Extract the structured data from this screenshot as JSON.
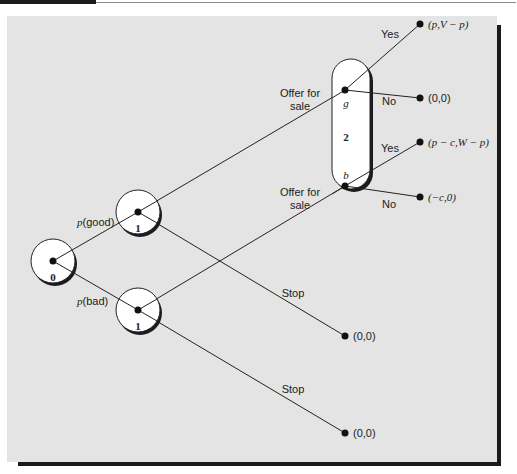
{
  "diagram": {
    "type": "extensive-form game tree",
    "nodes": {
      "root": {
        "player_label": "0"
      },
      "good_node": {
        "player_label": "1"
      },
      "bad_node": {
        "player_label": "1"
      },
      "info_set": {
        "player_label": "2",
        "good_label": "g",
        "bad_label": "b"
      }
    },
    "branches": {
      "p_good": {
        "prefix": "p",
        "suffix": "(good)"
      },
      "p_bad": {
        "prefix": "p",
        "suffix": "(bad)"
      },
      "offer_good": {
        "line1": "Offer for",
        "line2": "sale"
      },
      "offer_bad": {
        "line1": "Offer for",
        "line2": "sale"
      },
      "stop_good": "Stop",
      "stop_bad": "Stop",
      "yes_good": "Yes",
      "no_good": "No",
      "yes_bad": "Yes",
      "no_bad": "No"
    },
    "payoffs": {
      "good_yes": "(p,V − p)",
      "good_no": "(0,0)",
      "bad_yes": "(p − c,W − p)",
      "bad_no": "(−c,0)",
      "good_stop": "(0,0)",
      "bad_stop": "(0,0)"
    }
  }
}
